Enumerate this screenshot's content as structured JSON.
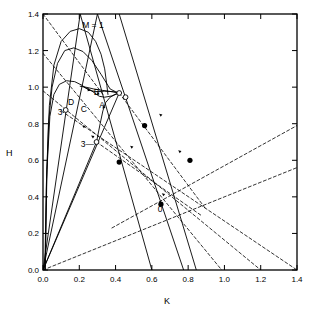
{
  "chart_data": {
    "type": "line",
    "title": "",
    "xlabel": "K",
    "ylabel": "H",
    "xlim": [
      0.0,
      1.4
    ],
    "ylim": [
      0.0,
      1.4
    ],
    "xticks": [
      "0.0",
      "0.2",
      "0.4",
      "0.6",
      "0.8",
      "1.0",
      "1.2",
      "1.4"
    ],
    "yticks": [
      "0.0",
      "0.2",
      "0.4",
      "0.6",
      "0.8",
      "1.0",
      "1.2",
      "1.4"
    ],
    "xtick_values": [
      0.0,
      0.2,
      0.4,
      0.6,
      0.8,
      1.0,
      1.2,
      1.4
    ],
    "ytick_values": [
      0.0,
      0.2,
      0.4,
      0.6,
      0.8,
      1.0,
      1.2,
      1.4
    ],
    "grid": false,
    "legend": "none",
    "annotations": [
      {
        "text": "M = 1",
        "x": 0.275,
        "y": 1.325
      },
      {
        "text": "A",
        "x": 0.325,
        "y": 0.885
      },
      {
        "text": "B",
        "x": 0.295,
        "y": 0.955
      },
      {
        "text": "C",
        "x": 0.225,
        "y": 0.865
      },
      {
        "text": "D",
        "x": 0.155,
        "y": 0.905
      },
      {
        "text": "3",
        "x": 0.095,
        "y": 0.845
      },
      {
        "text": "3—",
        "x": 0.245,
        "y": 0.675
      },
      {
        "text": "0",
        "x": 0.645,
        "y": 0.315
      }
    ],
    "markers_open": [
      {
        "x": 0.125,
        "y": 0.875
      },
      {
        "x": 0.295,
        "y": 0.7
      },
      {
        "x": 0.42,
        "y": 0.968
      },
      {
        "x": 0.455,
        "y": 0.945
      }
    ],
    "markers_filled": [
      {
        "x": 0.65,
        "y": 0.36
      },
      {
        "x": 0.42,
        "y": 0.59
      },
      {
        "x": 0.56,
        "y": 0.79
      },
      {
        "x": 0.81,
        "y": 0.6
      }
    ],
    "series": [
      {
        "name": "mach-curve-M1",
        "style": "solid",
        "points": [
          [
            0.012,
            0.0
          ],
          [
            0.02,
            0.5
          ],
          [
            0.035,
            0.9
          ],
          [
            0.06,
            1.12
          ],
          [
            0.1,
            1.25
          ],
          [
            0.15,
            1.305
          ],
          [
            0.2,
            1.32
          ],
          [
            0.25,
            1.3
          ],
          [
            0.29,
            1.25
          ],
          [
            0.32,
            1.18
          ],
          [
            0.34,
            1.1
          ],
          [
            0.352,
            1.01
          ],
          [
            0.358,
            0.96
          ]
        ]
      },
      {
        "name": "mach-curve-outer",
        "style": "solid",
        "points": [
          [
            0.01,
            0.0
          ],
          [
            0.018,
            0.45
          ],
          [
            0.03,
            0.8
          ],
          [
            0.05,
            1.0
          ],
          [
            0.08,
            1.13
          ],
          [
            0.12,
            1.2
          ],
          [
            0.17,
            1.215
          ],
          [
            0.22,
            1.195
          ],
          [
            0.27,
            1.145
          ],
          [
            0.32,
            1.07
          ],
          [
            0.37,
            0.99
          ],
          [
            0.4,
            0.975
          ],
          [
            0.42,
            0.968
          ]
        ]
      },
      {
        "name": "mach-curve-D",
        "style": "solid",
        "points": [
          [
            0.012,
            0.0
          ],
          [
            0.022,
            0.55
          ],
          [
            0.038,
            0.84
          ],
          [
            0.06,
            0.96
          ],
          [
            0.09,
            1.015
          ],
          [
            0.13,
            1.035
          ],
          [
            0.175,
            1.03
          ],
          [
            0.215,
            1.01
          ],
          [
            0.25,
            0.985
          ],
          [
            0.29,
            0.975
          ],
          [
            0.34,
            0.978
          ],
          [
            0.39,
            0.975
          ],
          [
            0.42,
            0.968
          ]
        ]
      },
      {
        "name": "mach-curve-C",
        "style": "solid",
        "points": [
          [
            0.205,
            1.005
          ],
          [
            0.235,
            1.0
          ],
          [
            0.28,
            0.99
          ],
          [
            0.33,
            0.982
          ],
          [
            0.38,
            0.975
          ],
          [
            0.42,
            0.968
          ]
        ]
      },
      {
        "name": "mach-curve-B",
        "style": "solid",
        "points": [
          [
            0.225,
            1.0
          ],
          [
            0.255,
            0.988
          ],
          [
            0.285,
            0.968
          ],
          [
            0.31,
            0.95
          ],
          [
            0.34,
            0.945
          ],
          [
            0.38,
            0.952
          ],
          [
            0.42,
            0.968
          ]
        ]
      },
      {
        "name": "mach-curve-A",
        "style": "solid",
        "points": [
          [
            0.295,
            0.7
          ],
          [
            0.315,
            0.8
          ],
          [
            0.33,
            0.87
          ],
          [
            0.345,
            0.915
          ],
          [
            0.37,
            0.945
          ],
          [
            0.4,
            0.962
          ],
          [
            0.42,
            0.968
          ]
        ]
      },
      {
        "name": "ray-from-origin-1",
        "style": "solid",
        "points": [
          [
            0.0,
            0.0
          ],
          [
            0.205,
            1.4
          ]
        ]
      },
      {
        "name": "ray-from-origin-2",
        "style": "solid",
        "points": [
          [
            0.0,
            0.0
          ],
          [
            0.3,
            1.4
          ]
        ]
      },
      {
        "name": "ray-from-origin-3",
        "style": "solid",
        "points": [
          [
            0.0,
            0.0
          ],
          [
            0.295,
            0.7
          ]
        ]
      },
      {
        "name": "ray-from-origin-4",
        "style": "solid",
        "points": [
          [
            0.0,
            0.0
          ],
          [
            0.42,
            0.968
          ]
        ]
      },
      {
        "name": "shock-line-1",
        "style": "solid",
        "points": [
          [
            0.205,
            1.4
          ],
          [
            0.6,
            0.0
          ]
        ]
      },
      {
        "name": "shock-line-2",
        "style": "solid",
        "points": [
          [
            0.3,
            1.4
          ],
          [
            0.775,
            0.0
          ]
        ]
      },
      {
        "name": "shock-line-3",
        "style": "solid",
        "points": [
          [
            0.42,
            1.4
          ],
          [
            0.845,
            0.0
          ]
        ]
      },
      {
        "name": "dashed-char-1",
        "style": "dashed",
        "points": [
          [
            0.0,
            1.4
          ],
          [
            0.33,
            0.96
          ]
        ]
      },
      {
        "name": "dashed-char-2",
        "style": "dashed",
        "points": [
          [
            0.0,
            1.185
          ],
          [
            0.985,
            0.0
          ]
        ]
      },
      {
        "name": "dashed-char-3",
        "style": "dashed",
        "points": [
          [
            0.0,
            0.98
          ],
          [
            1.2,
            0.0
          ]
        ]
      },
      {
        "name": "dashed-char-4",
        "style": "dashed",
        "points": [
          [
            0.1,
            0.87
          ],
          [
            1.4,
            0.0
          ]
        ]
      },
      {
        "name": "dashed-traj-upper",
        "style": "dashed",
        "points": [
          [
            0.42,
            0.968
          ],
          [
            0.9,
            0.33
          ]
        ]
      },
      {
        "name": "dashed-traj-lower",
        "style": "dashed",
        "points": [
          [
            0.295,
            0.7
          ],
          [
            0.87,
            0.3
          ]
        ]
      },
      {
        "name": "dashed-rising",
        "style": "dashed",
        "points": [
          [
            0.0,
            0.0
          ],
          [
            1.4,
            0.56
          ]
        ]
      },
      {
        "name": "dashed-rising-2",
        "style": "dashed",
        "points": [
          [
            0.38,
            0.23
          ],
          [
            1.4,
            0.79
          ]
        ]
      }
    ]
  },
  "axes": {
    "xlabel": "K",
    "ylabel": "H"
  }
}
